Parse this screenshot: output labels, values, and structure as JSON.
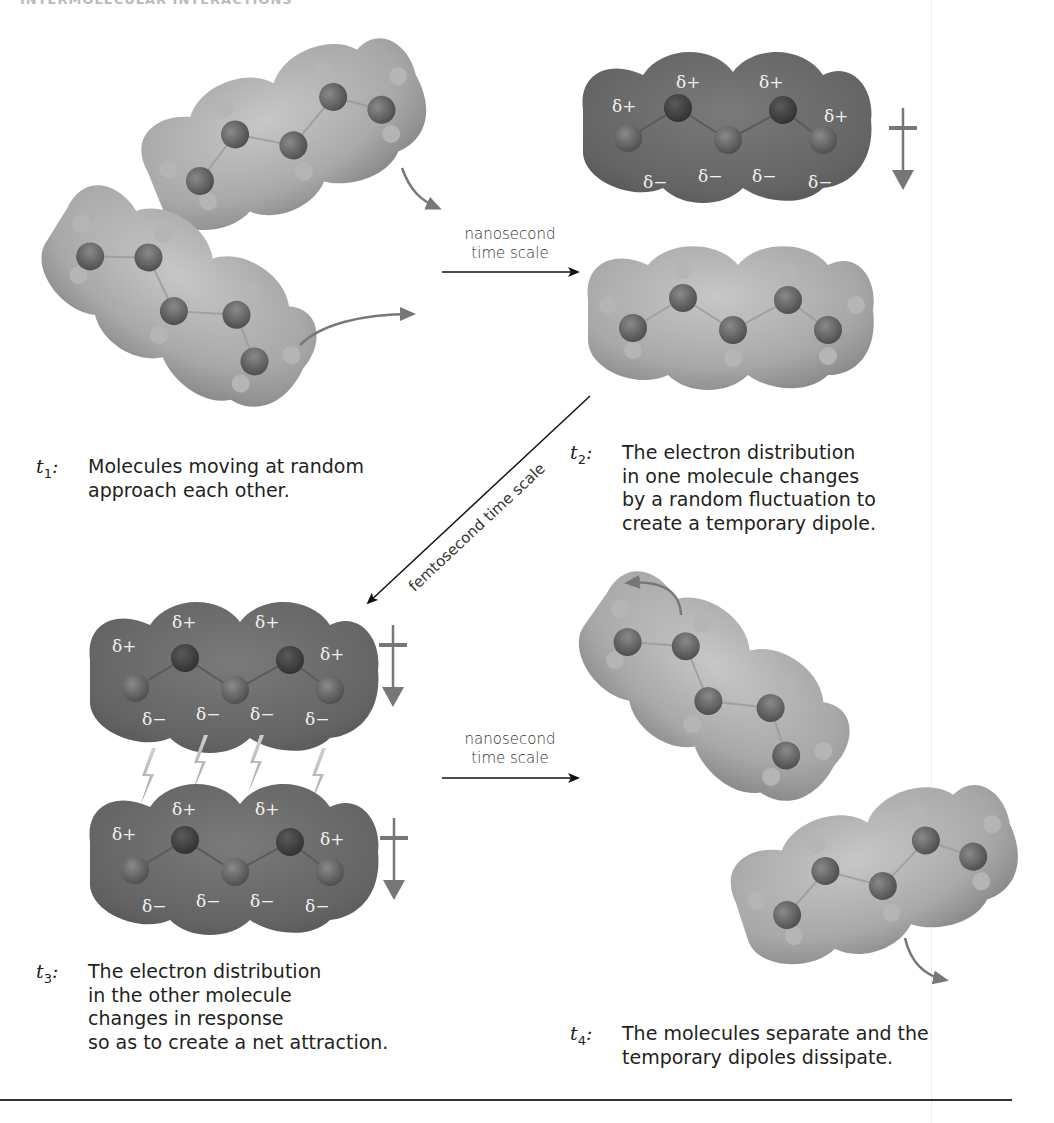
{
  "header": {
    "title": "INTERMOLECULAR INTERACTIONS"
  },
  "arrows": {
    "t1_to_t2": {
      "line1": "nanosecond",
      "line2": "time scale"
    },
    "t2_to_t3": {
      "label": "femtosecond time scale"
    },
    "t3_to_t4": {
      "line1": "nanosecond",
      "line2": "time scale"
    }
  },
  "delta": {
    "plus": "δ+",
    "minus": "δ−"
  },
  "captions": {
    "t1": {
      "label": "t",
      "sub": "1",
      "text": "Molecules moving at random\napproach each other."
    },
    "t2": {
      "label": "t",
      "sub": "2",
      "text": "The electron distribution\nin one molecule changes\nby a random fluctuation to\ncreate a temporary dipole."
    },
    "t3": {
      "label": "t",
      "sub": "3",
      "text": "The electron distribution\nin the other molecule\nchanges in response\nso as to create a net attraction."
    },
    "t4": {
      "label": "t",
      "sub": "4",
      "text": "The molecules separate and the\ntemporary dipoles dissipate."
    }
  },
  "colors": {
    "neutral_surface": "#a9a9a9",
    "dipole_surface": "#6e6e6e",
    "atom": "#6a6a6a",
    "arrow": "#757575",
    "text": "#231f20"
  }
}
